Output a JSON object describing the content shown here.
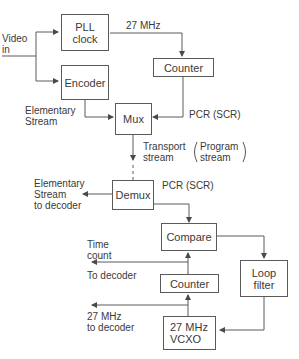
{
  "diagram": {
    "type": "block-diagram",
    "blocks": {
      "pll_clock": "PLL\nclock",
      "encoder": "Encoder",
      "counter_top": "Counter",
      "mux": "Mux",
      "demux": "Demux",
      "compare": "Compare",
      "counter_bottom": "Counter",
      "loop_filter": "Loop\nfilter",
      "vcxo": "27 MHz\nVCXO"
    },
    "labels": {
      "video_in": "Video\nin",
      "mhz_27": "27 MHz",
      "elementary_stream": "Elementary\nStream",
      "pcr_top": "PCR (SCR)",
      "transport_stream": "Transport\nstream",
      "program_stream": "Program\nstream",
      "elementary_to_decoder": "Elementary\nStream\nto decoder",
      "pcr_bottom": "PCR (SCR)",
      "time_count": "Time\ncount",
      "to_decoder": "To decoder",
      "mhz_27_to_decoder": "27 MHz\nto decoder"
    },
    "line_color": "#5a5a5a"
  }
}
